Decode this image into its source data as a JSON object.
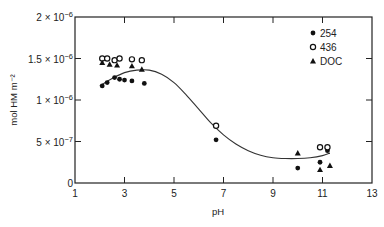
{
  "chart_data": {
    "type": "scatter",
    "title": "",
    "xlabel": "pH",
    "ylabel": "mol HM m⁻²",
    "xlim": [
      1,
      13
    ],
    "ylim": [
      0,
      2e-06
    ],
    "grid": false,
    "legend_position": "upper right",
    "x_ticks": [
      1,
      3,
      5,
      7,
      9,
      11,
      13
    ],
    "x_tick_labels": [
      "1",
      "3",
      "5",
      "7",
      "9",
      "11",
      "13"
    ],
    "y_ticks": [
      0,
      5e-07,
      1e-06,
      1.5e-06,
      2e-06
    ],
    "y_tick_labels": [
      {
        "mant": "0",
        "exp": ""
      },
      {
        "mant": "5 × 10",
        "exp": "−7"
      },
      {
        "mant": "1 × 10",
        "exp": "−6"
      },
      {
        "mant": "1.5 × 10",
        "exp": "−6"
      },
      {
        "mant": "2 × 10",
        "exp": "−6"
      }
    ],
    "series": [
      {
        "name": "254",
        "marker": "filled-circle",
        "points": [
          {
            "x": 2.1,
            "y": 1.17e-06
          },
          {
            "x": 2.3,
            "y": 1.21e-06
          },
          {
            "x": 2.6,
            "y": 1.27e-06
          },
          {
            "x": 2.8,
            "y": 1.25e-06
          },
          {
            "x": 3.0,
            "y": 1.24e-06
          },
          {
            "x": 3.3,
            "y": 1.23e-06
          },
          {
            "x": 3.8,
            "y": 1.2e-06
          },
          {
            "x": 6.7,
            "y": 5.2e-07
          },
          {
            "x": 10.0,
            "y": 1.8e-07
          },
          {
            "x": 10.9,
            "y": 2.5e-07
          },
          {
            "x": 11.2,
            "y": 3.9e-07
          }
        ]
      },
      {
        "name": "436",
        "marker": "open-circle",
        "points": [
          {
            "x": 2.1,
            "y": 1.5e-06
          },
          {
            "x": 2.3,
            "y": 1.5e-06
          },
          {
            "x": 2.6,
            "y": 1.48e-06
          },
          {
            "x": 2.8,
            "y": 1.5e-06
          },
          {
            "x": 3.3,
            "y": 1.49e-06
          },
          {
            "x": 3.7,
            "y": 1.48e-06
          },
          {
            "x": 6.7,
            "y": 6.9e-07
          },
          {
            "x": 10.9,
            "y": 4.3e-07
          },
          {
            "x": 11.2,
            "y": 4.3e-07
          }
        ]
      },
      {
        "name": "DOC",
        "marker": "filled-triangle",
        "points": [
          {
            "x": 2.1,
            "y": 1.45e-06
          },
          {
            "x": 2.4,
            "y": 1.43e-06
          },
          {
            "x": 2.7,
            "y": 1.42e-06
          },
          {
            "x": 3.3,
            "y": 1.41e-06
          },
          {
            "x": 3.7,
            "y": 1.37e-06
          },
          {
            "x": 10.0,
            "y": 3.6e-07
          },
          {
            "x": 10.9,
            "y": 1.6e-07
          },
          {
            "x": 11.3,
            "y": 2.1e-07
          }
        ]
      }
    ],
    "fit_curve": {
      "name": "fitted curve",
      "x": [
        2.0,
        2.5,
        3.0,
        3.5,
        4.0,
        4.5,
        5.0,
        5.5,
        6.0,
        6.5,
        7.0,
        7.5,
        8.0,
        8.5,
        9.0,
        9.5,
        10.0,
        10.5,
        11.0,
        11.3
      ],
      "y": [
        1.17e-06,
        1.26e-06,
        1.33e-06,
        1.36e-06,
        1.36e-06,
        1.31e-06,
        1.21e-06,
        1.06e-06,
        8.9e-07,
        7.2e-07,
        5.8e-07,
        4.7e-07,
        3.9e-07,
        3.35e-07,
        3.05e-07,
        2.95e-07,
        2.95e-07,
        3.05e-07,
        3.3e-07,
        3.6e-07
      ]
    }
  },
  "legend": {
    "items": [
      {
        "label": "254",
        "marker": "filled-circle"
      },
      {
        "label": "436",
        "marker": "open-circle"
      },
      {
        "label": "DOC",
        "marker": "filled-triangle"
      }
    ]
  },
  "axes": {
    "xlabel": "pH",
    "ylabel": "mol HM m⁻²"
  }
}
